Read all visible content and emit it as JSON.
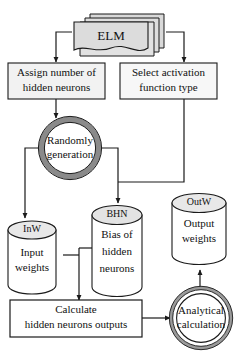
{
  "diagram": {
    "colors": {
      "stroke": "#1a1a1a",
      "fill_gray": "#d9d9d9",
      "fill_gray_light": "#e6e6e6",
      "ring_gray": "#8c8c8c",
      "white": "#ffffff",
      "text": "#111111"
    },
    "nodes": {
      "elm": {
        "shape": "stacked-document",
        "label": "ELM"
      },
      "assign_neurons": {
        "shape": "rectangle",
        "line1": "Assign number of",
        "line2": "hidden neurons"
      },
      "select_activation": {
        "shape": "rectangle",
        "line1": "Select activation",
        "line2": "function type"
      },
      "randomly_generation": {
        "shape": "ring-circle",
        "line1": "Randomly",
        "line2": "generation"
      },
      "input_weights": {
        "shape": "cylinder",
        "tag": "InW",
        "line1": "Input",
        "line2": "weights"
      },
      "bias_hidden_neurons": {
        "shape": "cylinder",
        "tag": "BHN",
        "line1": "Bias of",
        "line2": "hidden",
        "line3": "neurons"
      },
      "output_weights": {
        "shape": "cylinder",
        "tag": "OutW",
        "line1": "Output",
        "line2": "weights"
      },
      "calculate_outputs": {
        "shape": "rectangle",
        "line1": "Calculate",
        "line2": "hidden neurons outputs"
      },
      "analytical_calculation": {
        "shape": "double-circle",
        "line1": "Analytical",
        "line2": "calculation"
      }
    },
    "edges": [
      {
        "name": "elm-to-assign-neurons",
        "from": "elm",
        "to": "assign_neurons",
        "arrow": true
      },
      {
        "name": "elm-to-select-activation",
        "from": "elm",
        "to": "select_activation",
        "arrow": true
      },
      {
        "name": "assign-neurons-to-random",
        "from": "assign_neurons",
        "to": "randomly_generation",
        "arrow": true
      },
      {
        "name": "random-to-input-weights",
        "from": "randomly_generation",
        "to": "input_weights",
        "arrow": true
      },
      {
        "name": "random-to-bias-hidden",
        "from": "randomly_generation",
        "to": "bias_hidden_neurons",
        "arrow": true
      },
      {
        "name": "select-activation-to-bias-hidden",
        "from": "select_activation",
        "to": "bias_hidden_neurons",
        "arrow": true
      },
      {
        "name": "weights-to-calculate",
        "from": "input_weights",
        "to": "calculate_outputs",
        "arrow": true
      },
      {
        "name": "calculate-to-analytical",
        "from": "calculate_outputs",
        "to": "analytical_calculation",
        "arrow": true
      },
      {
        "name": "analytical-to-output-weights",
        "from": "analytical_calculation",
        "to": "output_weights",
        "arrow": true
      }
    ]
  }
}
